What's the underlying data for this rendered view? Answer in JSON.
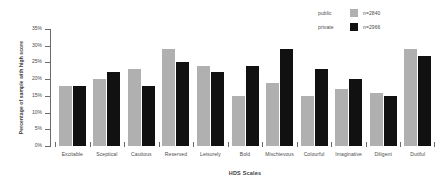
{
  "chart_data": {
    "type": "bar",
    "title": "",
    "xlabel": "HDS Scales",
    "ylabel": "Percentage of sample with high score",
    "ylim": [
      0,
      35
    ],
    "ytick_labels": [
      "0%",
      "5%",
      "10%",
      "15%",
      "20%",
      "25%",
      "30%",
      "35%"
    ],
    "ytick_values": [
      0,
      5,
      10,
      15,
      20,
      25,
      30,
      35
    ],
    "grid": false,
    "legend_position": "top-right",
    "categories": [
      "Excitable",
      "Sceptical",
      "Cautious",
      "Reserved",
      "Leisurely",
      "Bold",
      "Mischievous",
      "Colourful",
      "Imaginative",
      "Diligent",
      "Dutiful"
    ],
    "series": [
      {
        "name": "public",
        "legend_note": "n=2840",
        "color": "#b0b0b0",
        "values": [
          18,
          20,
          23,
          29,
          24,
          15,
          19,
          15,
          17,
          16,
          29
        ]
      },
      {
        "name": "private",
        "legend_note": "n=2966",
        "color": "#111111",
        "values": [
          18,
          22,
          18,
          25,
          22,
          24,
          29,
          23,
          20,
          15,
          27
        ]
      }
    ]
  },
  "legend": {
    "rows": [
      {
        "label": "public",
        "note": "n=2840"
      },
      {
        "label": "private",
        "note": "n=2966"
      }
    ]
  }
}
